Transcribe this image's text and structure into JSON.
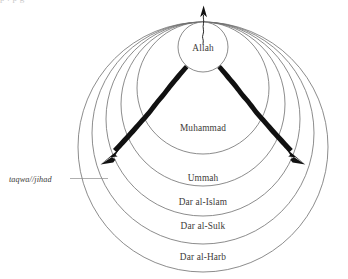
{
  "figure": {
    "type": "concentric-circles-diagram",
    "background_color": "#ffffff",
    "line_color": "#6e6e6e",
    "arrow_color": "#111111",
    "text_color": "#3d3a38"
  },
  "core": {
    "label": "Allah",
    "name": "core-circle-allah"
  },
  "rings": [
    {
      "label": "Muhammad",
      "name": "ring-muhammad"
    },
    {
      "label": "Ummah",
      "name": "ring-ummah"
    },
    {
      "label": "Dar al-Islam",
      "name": "ring-dar-al-islam"
    },
    {
      "label": "Dar al-Sulk",
      "name": "ring-dar-al-sulk"
    },
    {
      "label": "Dar al-Harb",
      "name": "ring-dar-al-harb"
    }
  ],
  "annotation": {
    "label": "taqwa//jihad",
    "name": "annotation-taqwa-jihad"
  },
  "arrows": {
    "up": "upward-arrow",
    "down_left": "downward-left-arrow",
    "down_right": "downward-right-arrow"
  },
  "page_artifact": {
    "clipped_line": "p   .    p      g"
  }
}
